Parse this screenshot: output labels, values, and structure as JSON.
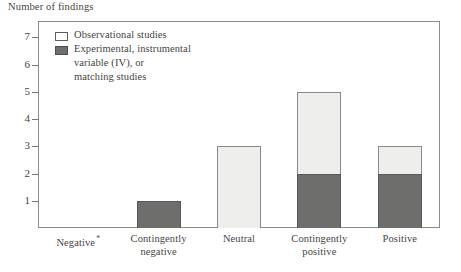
{
  "chart_data": {
    "type": "bar",
    "subtype": "stacked-vertical",
    "title": "",
    "ylabel": "Number of findings",
    "xlabel": "",
    "ylim": [
      0,
      7.6
    ],
    "yticks": [
      1,
      2,
      3,
      4,
      5,
      6,
      7
    ],
    "ytick_labels": [
      "1",
      "2",
      "3",
      "4",
      "5",
      "6",
      "7"
    ],
    "grid": false,
    "legend_position": "top-left-inside",
    "categories": [
      "Negative",
      "Contingently negative",
      "Neutral",
      "Contingently positive",
      "Positive"
    ],
    "category_labels": [
      {
        "line1": "Negative",
        "line2": "",
        "superscript": "*"
      },
      {
        "line1": "Contingently",
        "line2": "negative",
        "superscript": ""
      },
      {
        "line1": "Neutral",
        "line2": "",
        "superscript": ""
      },
      {
        "line1": "Contingently",
        "line2": "positive",
        "superscript": ""
      },
      {
        "line1": "Positive",
        "line2": "",
        "superscript": ""
      }
    ],
    "series": [
      {
        "name": "Experimental, instrumental variable (IV), or matching studies",
        "color": "#6e6e6c",
        "values": [
          0,
          1,
          0,
          2,
          2
        ]
      },
      {
        "name": "Observational studies",
        "color": "#eeeeec",
        "values": [
          0,
          0,
          3,
          3,
          1
        ]
      }
    ],
    "totals": [
      0,
      1,
      3,
      5,
      3
    ]
  },
  "legend": {
    "items": [
      {
        "swatch": "light",
        "line1": "Observational studies",
        "line2": "",
        "line3": ""
      },
      {
        "swatch": "dark",
        "line1": "Experimental, instrumental",
        "line2": "variable (IV), or",
        "line3": "matching studies"
      }
    ]
  },
  "colors": {
    "observational": "#eeeeec",
    "experimental": "#6e6e6c",
    "frame": "#8a8a86",
    "text": "#46443f"
  }
}
